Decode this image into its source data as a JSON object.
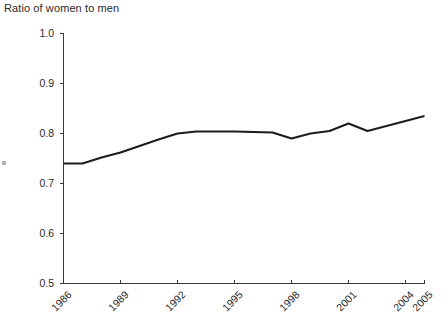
{
  "chart_data": {
    "type": "line",
    "title": "Ratio of women to men",
    "xlabel": "",
    "ylabel": "",
    "ylim": [
      0.5,
      1.0
    ],
    "xlim": [
      1986,
      2005
    ],
    "grid": false,
    "legend": false,
    "ytick_labels": [
      "1.0",
      "0.9",
      "0.8",
      "0.7",
      "0.6",
      "0.5"
    ],
    "ytick_values": [
      1.0,
      0.9,
      0.8,
      0.7,
      0.6,
      0.5
    ],
    "xtick_labels": [
      "1986",
      "1989",
      "1992",
      "1995",
      "1998",
      "2001",
      "2004",
      "2005"
    ],
    "xtick_values": [
      1986,
      1989,
      1992,
      1995,
      1998,
      2001,
      2004,
      2005
    ],
    "series": [
      {
        "name": "Ratio of women to men",
        "color": "#1c1c1c",
        "x": [
          1986,
          1987,
          1988,
          1989,
          1990,
          1991,
          1992,
          1993,
          1994,
          1995,
          1996,
          1997,
          1998,
          1999,
          2000,
          2001,
          2002,
          2003,
          2004,
          2005
        ],
        "values": [
          0.74,
          0.74,
          0.752,
          0.762,
          0.775,
          0.788,
          0.8,
          0.804,
          0.804,
          0.804,
          0.803,
          0.802,
          0.79,
          0.8,
          0.805,
          0.82,
          0.805,
          0.815,
          0.825,
          0.835
        ]
      }
    ]
  }
}
